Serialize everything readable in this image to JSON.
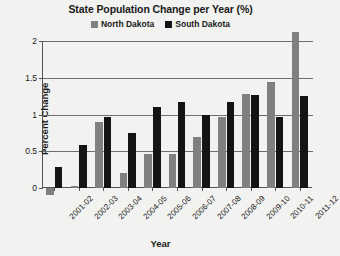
{
  "chart_data": {
    "type": "bar",
    "title": "State Population Change per Year (%)",
    "xlabel": "Year",
    "ylabel": "Percent Change",
    "categories": [
      "2001-02",
      "2002-03",
      "2003-04",
      "2004-05",
      "2005-06",
      "2006-07",
      "2007-08",
      "2008-09",
      "2009-10",
      "2010-11",
      "2011-12"
    ],
    "series": [
      {
        "name": "North Dakota",
        "color": "#808080",
        "values": [
          -0.1,
          0.03,
          0.9,
          0.2,
          0.46,
          0.46,
          0.7,
          0.97,
          1.28,
          1.44,
          2.12
        ]
      },
      {
        "name": "South Dakota",
        "color": "#141414",
        "values": [
          0.28,
          0.58,
          0.97,
          0.75,
          1.1,
          1.17,
          1.0,
          1.17,
          1.27,
          0.97,
          1.25
        ]
      }
    ],
    "ylim": [
      0,
      2
    ],
    "yticks": [
      0,
      0.5,
      1,
      1.5,
      2
    ],
    "ytick_labels": [
      "0",
      "0.5",
      "1",
      "1.5",
      "2"
    ],
    "grid": true,
    "legend_position": "top-center"
  }
}
